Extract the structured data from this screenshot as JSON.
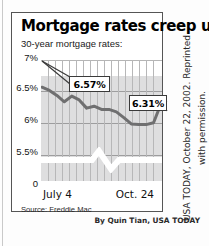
{
  "title": "Mortgage rates creep up",
  "subtitle": "30-year mortgage rates:",
  "source": "Source: Freddie Mac",
  "credit": "By Quin Tian, USA TODAY",
  "copyright_line1": "USA TODAY, October 22, 2002. Reprinted",
  "copyright_line2": "with permission.",
  "callouts": {
    "start": "6.57%",
    "end": "6.31%"
  },
  "axis": {
    "y_ticks": [
      "7%",
      "6.5%",
      "6%",
      "5.5%",
      "0"
    ],
    "x_start": "July 4",
    "x_end": "Oct. 24"
  },
  "colors": {
    "line": "#6f6f70",
    "plot_fill": "#dededf",
    "grid": "#b7b7b8",
    "border": "#555555",
    "text": "#111111"
  },
  "chart_data": {
    "type": "line",
    "title": "Mortgage rates creep up",
    "subtitle": "30-year mortgage rates:",
    "xlabel": "",
    "ylabel": "30-year mortgage rates",
    "ylim": [
      5.5,
      7.0
    ],
    "y_ticks": [
      5.5,
      6.0,
      6.5,
      7.0
    ],
    "y_tick_labels": [
      "5.5%",
      "6%",
      "6.5%",
      "7%"
    ],
    "zero_break": true,
    "grid": true,
    "legend": null,
    "x_tick_labels": [
      "July 4",
      "Oct. 24"
    ],
    "x": [
      "Jul 4",
      "Jul 11",
      "Jul 18",
      "Jul 25",
      "Aug 1",
      "Aug 8",
      "Aug 15",
      "Aug 22",
      "Aug 29",
      "Sep 5",
      "Sep 12",
      "Sep 19",
      "Sep 26",
      "Oct 3",
      "Oct 10",
      "Oct 17",
      "Oct 24"
    ],
    "values": [
      6.57,
      6.52,
      6.44,
      6.34,
      6.43,
      6.37,
      6.24,
      6.27,
      6.22,
      6.22,
      6.18,
      6.09,
      5.99,
      5.98,
      5.98,
      6.01,
      6.31
    ],
    "annotations": [
      {
        "label": "6.57%",
        "x": "Jul 4",
        "y": 6.57
      },
      {
        "label": "6.31%",
        "x": "Oct 24",
        "y": 6.31
      }
    ],
    "source": "Source: Freddie Mac"
  }
}
